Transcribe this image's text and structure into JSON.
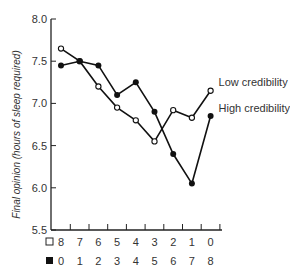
{
  "chart_data": {
    "type": "line",
    "title": "",
    "xlabel": "",
    "ylabel": "Final opinion (hours of sleep required)",
    "ylim": [
      5.5,
      8.0
    ],
    "yticks": [
      "5.5",
      "6.0",
      "6.5",
      "7.0",
      "7.5",
      "8.0"
    ],
    "x_rows": [
      {
        "marker": "open-square",
        "labels": [
          "8",
          "7",
          "6",
          "5",
          "4",
          "3",
          "2",
          "1",
          "0"
        ]
      },
      {
        "marker": "filled-square",
        "labels": [
          "0",
          "1",
          "2",
          "3",
          "4",
          "5",
          "6",
          "7",
          "8"
        ]
      }
    ],
    "series": [
      {
        "name": "Low credibility",
        "marker": "open-circle",
        "values": [
          7.65,
          7.5,
          7.2,
          6.95,
          6.8,
          6.55,
          6.92,
          6.83,
          7.15
        ]
      },
      {
        "name": "High credibility",
        "marker": "filled-circle",
        "values": [
          7.45,
          7.5,
          7.45,
          7.1,
          7.25,
          6.9,
          6.4,
          6.05,
          6.85
        ]
      }
    ],
    "grid": false,
    "legend_position": "inline-right"
  }
}
